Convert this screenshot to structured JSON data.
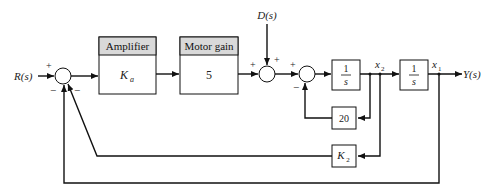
{
  "diagram": {
    "input_label": "R(s)",
    "disturbance_label": "D(s)",
    "output_label": "Y(s)",
    "amplifier": {
      "header": "Amplifier",
      "gain": "K",
      "gain_sub": "a"
    },
    "motor": {
      "header": "Motor gain",
      "gain": "5"
    },
    "integrator1": {
      "num": "1",
      "den": "s"
    },
    "integrator2": {
      "num": "1",
      "den": "s"
    },
    "inner_feedback": {
      "gain": "20"
    },
    "velocity_feedback": {
      "gain": "K",
      "gain_sub": "2"
    },
    "state_x2": {
      "name": "x",
      "sub": "2"
    },
    "state_x1": {
      "name": "x",
      "sub": "1"
    },
    "signs": {
      "sum1_in": "+",
      "sum1_fb1": "−",
      "sum1_fb2": "−",
      "sum2_in": "+",
      "sum2_d": "+",
      "sum3_in": "+",
      "sum3_fb": "−"
    },
    "colors": {
      "line": "#111111",
      "header_fill": "#d9d9d9",
      "box_fill": "#ffffff"
    }
  }
}
